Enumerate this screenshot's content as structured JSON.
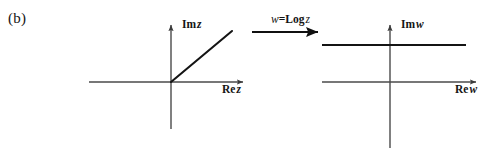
{
  "figure": {
    "panel_label": "(b)",
    "background_color": "#ffffff",
    "ink_color": "#141414",
    "axis_color": "#4a4a4a",
    "width": 492,
    "height": 148
  },
  "mapping_arrow": {
    "formula_lhs": "w",
    "formula_equals": "=",
    "formula_op": "Log",
    "formula_arg": "z",
    "formula_plain": "w = Log z",
    "icon": "right-arrow-icon",
    "x_start": 252,
    "x_end": 327,
    "y": 32
  },
  "z_plane": {
    "name": "z-plane",
    "origin": {
      "x": 171,
      "y": 82
    },
    "imaginary_axis_label_prefix": "Im",
    "imaginary_axis_label_var": "z",
    "imaginary_axis_label": "Im z",
    "real_axis_label_prefix": "Re",
    "real_axis_label_var": "z",
    "real_axis_label": "Re z",
    "real_axis": {
      "x_start": 89,
      "x_end": 247,
      "y": 82
    },
    "imaginary_axis": {
      "x": 171,
      "y_start": 22,
      "y_end": 129
    },
    "ray": {
      "description": "ray from origin at 45 degrees into first quadrant",
      "x_start": 171,
      "y_start": 82,
      "x_end": 232,
      "y_end": 31,
      "angle_degrees": 40
    }
  },
  "w_plane": {
    "name": "w-plane",
    "origin": {
      "x": 390,
      "y": 82
    },
    "imaginary_axis_label_prefix": "Im",
    "imaginary_axis_label_var": "w",
    "imaginary_axis_label": "Im w",
    "real_axis_label_prefix": "Re",
    "real_axis_label_var": "w",
    "real_axis_label": "Re w",
    "real_axis": {
      "x_start": 322,
      "x_end": 480,
      "y": 82
    },
    "imaginary_axis": {
      "x": 390,
      "y_start": 22,
      "y_end": 148
    },
    "horizontal_line": {
      "description": "horizontal line of constant imaginary part, image of the ray",
      "x_start": 322,
      "x_end": 466,
      "y": 45
    }
  }
}
